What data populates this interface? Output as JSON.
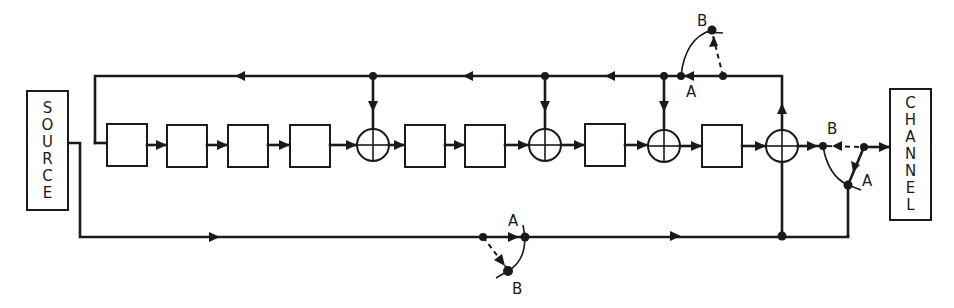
{
  "diagram": {
    "type": "shift-register encoder block diagram",
    "source_label": "SOURCE",
    "channel_label": "CHANNEL",
    "source_letters": [
      "S",
      "O",
      "U",
      "R",
      "C",
      "E"
    ],
    "channel_letters": [
      "C",
      "H",
      "A",
      "N",
      "N",
      "E",
      "L"
    ],
    "switch_labels": {
      "top": {
        "a": "A",
        "b": "B"
      },
      "right": {
        "a": "A",
        "b": "B"
      },
      "bottom": {
        "a": "A",
        "b": "B"
      }
    },
    "register_stages": 8,
    "modulo2_adders": 4,
    "colors": {
      "ink": "#1a1a1a",
      "background": "#ffffff"
    }
  }
}
